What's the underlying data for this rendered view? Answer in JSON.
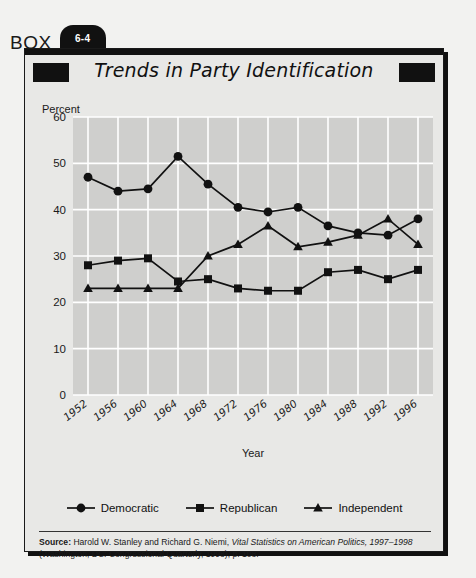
{
  "box": {
    "label": "BOX",
    "number": "6-4"
  },
  "title": "Trends in Party Identification",
  "axis": {
    "ylabel": "Percent",
    "xlabel": "Year"
  },
  "legend": [
    {
      "label": "Democratic",
      "marker": "circle"
    },
    {
      "label": "Republican",
      "marker": "square"
    },
    {
      "label": "Independent",
      "marker": "triangle"
    }
  ],
  "source": {
    "prefix": "Source:",
    "line1_a": " Harold W. Stanley and Richard G. Niemi, ",
    "line1_italic": "Vital Statistics on American Politics, 1997–1998",
    "line2": "(Washington, DC: Congressional Quarterly, 1998), p. 108."
  },
  "chart_data": {
    "type": "line",
    "title": "Trends in Party Identification",
    "xlabel": "Year",
    "ylabel": "Percent",
    "ylim": [
      0,
      60
    ],
    "yticks": [
      0,
      10,
      20,
      30,
      40,
      50,
      60
    ],
    "grid": true,
    "legend_position": "bottom",
    "categories": [
      "1952",
      "1956",
      "1960",
      "1964",
      "1968",
      "1972",
      "1976",
      "1980",
      "1984",
      "1988",
      "1992",
      "1996"
    ],
    "series": [
      {
        "name": "Democratic",
        "marker": "circle",
        "values": [
          47,
          44,
          44.5,
          51.5,
          45.5,
          40.5,
          39.5,
          40.5,
          36.5,
          35,
          34.5,
          38
        ]
      },
      {
        "name": "Republican",
        "marker": "square",
        "values": [
          28,
          29,
          29.5,
          24.5,
          25,
          23,
          22.5,
          22.5,
          26.5,
          27,
          25,
          27
        ]
      },
      {
        "name": "Independent",
        "marker": "triangle",
        "values": [
          23,
          23,
          23,
          23,
          30,
          32.5,
          36.5,
          32,
          33,
          34.5,
          38,
          32.5
        ]
      }
    ]
  }
}
